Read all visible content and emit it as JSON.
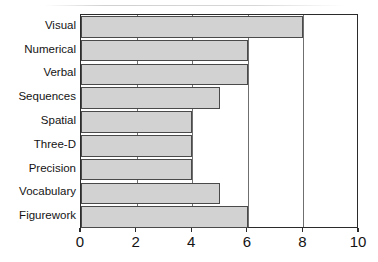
{
  "chart_data": {
    "type": "bar",
    "orientation": "horizontal",
    "title": "",
    "xlabel": "",
    "ylabel": "",
    "categories": [
      "Visual",
      "Numerical",
      "Verbal",
      "Sequences",
      "Spatial",
      "Three-D",
      "Precision",
      "Vocabulary",
      "Figurework"
    ],
    "values": [
      8,
      6,
      6,
      5,
      4,
      4,
      4,
      5,
      6
    ],
    "xlim": [
      0,
      10
    ],
    "xticks": [
      0,
      2,
      4,
      6,
      8,
      10
    ],
    "xtick_labels": [
      "0",
      "2",
      "4",
      "6",
      "8",
      "10"
    ],
    "grid": true,
    "legend": null,
    "bar_fill_color": "#d2d2d2",
    "bar_edge_color": "#4a4a4a",
    "axis_color": "#2b2b2b",
    "text_color": "#141414"
  }
}
